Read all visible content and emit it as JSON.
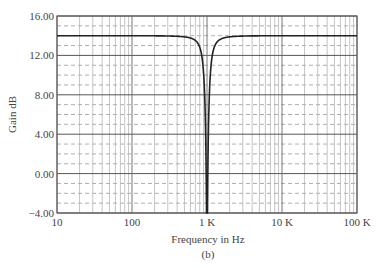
{
  "chart_data": {
    "type": "line",
    "title": "",
    "subtitle": "(b)",
    "xlabel": "Frequency in Hz",
    "ylabel": "Gain dB",
    "xscale": "log",
    "xlim": [
      10,
      100000
    ],
    "ylim": [
      -4,
      16
    ],
    "grid": true,
    "x_ticks": [
      10,
      100,
      1000,
      10000,
      100000
    ],
    "x_tick_labels": [
      "10",
      "100",
      "1 K",
      "10 K",
      "100 K"
    ],
    "y_ticks": [
      -4,
      0,
      4,
      8,
      12,
      16
    ],
    "y_tick_labels": [
      "-4.00",
      "0.00",
      "4.00",
      "8.00",
      "12.00",
      "16.00"
    ],
    "y_minor_step": 1,
    "series": [
      {
        "name": "Notch filter gain",
        "description": "Flat passband gain ~14 dB with a deep notch at ~1 kHz",
        "x": [
          10,
          100,
          300,
          500,
          700,
          800,
          900,
          950,
          980,
          1000,
          1020,
          1050,
          1100,
          1250,
          1400,
          2000,
          3300,
          10000,
          100000
        ],
        "y": [
          14.0,
          14.0,
          13.9,
          13.7,
          13.2,
          12.5,
          10.5,
          7.0,
          1.0,
          -4.0,
          1.0,
          7.0,
          10.5,
          12.5,
          13.2,
          13.7,
          13.9,
          14.0,
          14.0
        ]
      }
    ],
    "notch_frequency_hz": 1000,
    "passband_gain_db": 14
  }
}
